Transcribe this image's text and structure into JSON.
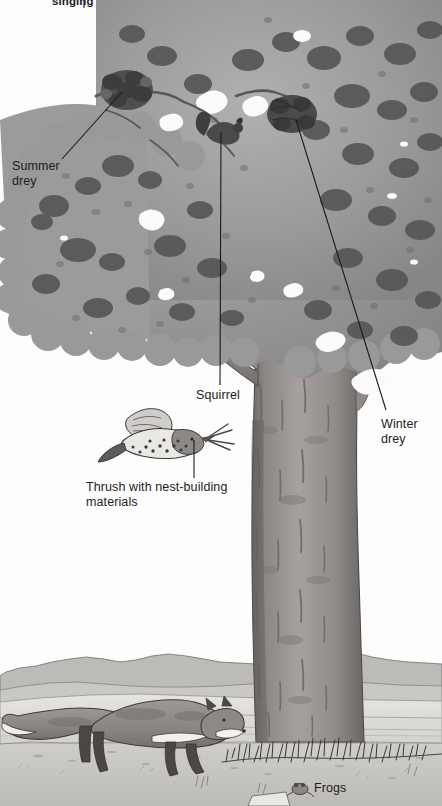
{
  "illustration": {
    "title": "Oak tree wildlife cross-section",
    "subject": "oak-tree",
    "palette": {
      "background": "#ffffff",
      "paper": "#fdfdfd",
      "canopy_light": "#a9a9a9",
      "canopy_mid": "#8e8e8e",
      "canopy_dark": "#5c5c5c",
      "canopy_darkest": "#3d3d3d",
      "trunk_light": "#a6a2a0",
      "trunk_mid": "#8b8684",
      "trunk_dark": "#6a6563",
      "ground": "#c9c7c4",
      "field": "#dedcd8",
      "hill": "#b9b7b3",
      "fox_body": "#8f8a86",
      "fox_dark": "#4a4745",
      "fox_white": "#f2f1ee",
      "ink": "#1c1c1c",
      "leader_line": "#1a1a1a",
      "label_text": "#1c1c1c"
    }
  },
  "labels": [
    {
      "id": "singing",
      "name": "label-singing",
      "text": "singing",
      "x": 52,
      "y": -4,
      "style": "small",
      "note": "cropped at top edge"
    },
    {
      "id": "summer_drey",
      "name": "label-summer-drey",
      "text": "Summer\ndrey",
      "x": 12,
      "y": 160,
      "style": "normal"
    },
    {
      "id": "squirrel",
      "name": "label-squirrel",
      "text": "Squirrel",
      "x": 196,
      "y": 389,
      "style": "normal"
    },
    {
      "id": "winter_drey",
      "name": "label-winter-drey",
      "text": "Winter\ndrey",
      "x": 381,
      "y": 418,
      "style": "normal"
    },
    {
      "id": "thrush",
      "name": "label-thrush",
      "text": "Thrush with nest-building\nmaterials",
      "x": 86,
      "y": 481,
      "style": "normal"
    },
    {
      "id": "frogs",
      "name": "label-frogs",
      "text": "Frogs",
      "x": 314,
      "y": 787,
      "style": "frogs"
    }
  ],
  "leader_lines": [
    {
      "id": "summer_drey_line",
      "name": "leader-line-summer-drey",
      "x1": 62,
      "y1": 159,
      "x2": 122,
      "y2": 92
    },
    {
      "id": "squirrel_line",
      "name": "leader-line-squirrel",
      "x1": 220,
      "y1": 385,
      "x2": 221,
      "y2": 132
    },
    {
      "id": "winter_drey_line",
      "name": "leader-line-winter-drey",
      "x1": 386,
      "y1": 410,
      "x2": 296,
      "y2": 120
    },
    {
      "id": "thrush_line",
      "name": "leader-line-thrush",
      "x1": 194,
      "y1": 478,
      "x2": 194,
      "y2": 440
    },
    {
      "id": "singing_line",
      "name": "leader-line-singing",
      "x1": 84,
      "y1": 6,
      "x2": 84,
      "y2": 0
    }
  ],
  "figures": [
    {
      "id": "thrush_bird",
      "name": "thrush-bird-figure",
      "cx": 160,
      "cy": 437
    },
    {
      "id": "fox",
      "name": "fox-figure",
      "cx": 120,
      "cy": 730
    },
    {
      "id": "frog",
      "name": "frog-figure",
      "cx": 300,
      "cy": 789
    },
    {
      "id": "summer_drey_nest",
      "name": "summer-drey-nest",
      "cx": 127,
      "cy": 88
    },
    {
      "id": "winter_drey_nest",
      "name": "winter-drey-nest",
      "cx": 292,
      "cy": 113
    },
    {
      "id": "squirrel_animal",
      "name": "squirrel-figure",
      "cx": 222,
      "cy": 126
    }
  ],
  "scene": {
    "horizon_y": 658,
    "ground_y": 742,
    "trunk_left": 258,
    "trunk_right": 360,
    "canopy_bottom": 430
  }
}
